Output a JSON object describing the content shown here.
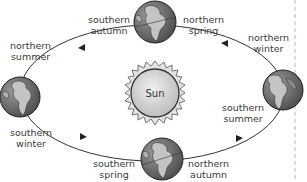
{
  "diagram": {
    "center": {
      "label": "Sun"
    },
    "positions": [
      {
        "id": "top",
        "labels": [
          {
            "line1": "southern",
            "line2": "autumn"
          },
          {
            "line1": "northern",
            "line2": "spring"
          }
        ]
      },
      {
        "id": "right",
        "labels": [
          {
            "line1": "northern",
            "line2": "winter"
          },
          {
            "line1": "southern",
            "line2": "summer"
          }
        ]
      },
      {
        "id": "bottom",
        "labels": [
          {
            "line1": "southern",
            "line2": "spring"
          },
          {
            "line1": "northern",
            "line2": "autumn"
          }
        ]
      },
      {
        "id": "left",
        "labels": [
          {
            "line1": "northern",
            "line2": "summer"
          },
          {
            "line1": "southern",
            "line2": "winter"
          }
        ]
      }
    ],
    "orbit_direction": "counter-clockwise",
    "colors": {
      "orbit_line": "#333333",
      "sun_fill": "#d4d4d4",
      "earth_ocean": "#6e6e6e",
      "earth_land": "#bdbdbd",
      "dashed_divider": "#c8c8c8"
    }
  }
}
